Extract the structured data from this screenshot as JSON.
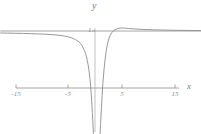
{
  "figure": {
    "axis_labels": {
      "x": "x",
      "y": "y"
    },
    "x_ticks": [
      {
        "value": -15,
        "label": "-15",
        "px": 16
      },
      {
        "value": -5,
        "label": "-5",
        "px": 68
      },
      {
        "value": 5,
        "label": "5",
        "px": 122
      },
      {
        "value": 15,
        "label": "15",
        "px": 175
      }
    ],
    "y_ticks": [
      {
        "value": 1,
        "label": "1",
        "px": 31
      }
    ],
    "colors": {
      "axis": "#9a9a9a",
      "curve": "#8c8c8c",
      "asymptote": "#9a9a9a",
      "text": "#7d7d7d",
      "background": "#ffffff"
    }
  },
  "chart_data": {
    "type": "line",
    "title": "",
    "xlabel": "x",
    "ylabel": "y",
    "xlim": [
      -17.8,
      20.0
    ],
    "ylim": [
      -1.55,
      1.35
    ],
    "grid": false,
    "legend": null,
    "annotations": [
      {
        "text": "horizontal asymptote y = 1"
      },
      {
        "text": "sharp downward spike near x = 0"
      }
    ],
    "xticks": [
      -15,
      -5,
      5,
      15
    ],
    "yticks": [
      1
    ],
    "series": [
      {
        "name": "asymptote",
        "style": "solid",
        "x": [
          -17.8,
          20.0
        ],
        "y": [
          1,
          1
        ]
      },
      {
        "name": "curve",
        "style": "solid",
        "x": [
          -17.8,
          -16.5,
          -15.0,
          -13.5,
          -12.0,
          -10.5,
          -9.5,
          -8.5,
          -7.5,
          -6.8,
          -6.2,
          -5.6,
          -5.0,
          -4.5,
          -4.1,
          -3.7,
          -3.3,
          -3.0,
          -2.7,
          -2.45,
          -2.2,
          -2.0,
          -1.8,
          -1.6,
          -1.45,
          -1.3,
          -1.15,
          -1.0,
          -0.88,
          -0.75,
          -0.62,
          -0.5,
          -0.38,
          -0.25,
          -0.12,
          0.0,
          0.12,
          0.25,
          0.38,
          0.5,
          0.62,
          0.75,
          0.9,
          1.05,
          1.2,
          1.35,
          1.5,
          1.7,
          1.9,
          2.1,
          2.35,
          2.6,
          2.9,
          3.2,
          3.6,
          4.0,
          4.5,
          5.0,
          5.6,
          6.3,
          7.2,
          8.2,
          9.5,
          11.0,
          13.0,
          15.5,
          18.0,
          20.0
        ],
        "y": [
          0.965,
          0.963,
          0.96,
          0.957,
          0.953,
          0.948,
          0.944,
          0.939,
          0.932,
          0.925,
          0.918,
          0.908,
          0.896,
          0.882,
          0.868,
          0.85,
          0.827,
          0.805,
          0.775,
          0.742,
          0.7,
          0.66,
          0.608,
          0.545,
          0.485,
          0.408,
          0.318,
          0.205,
          0.09,
          -0.06,
          -0.235,
          -0.43,
          -0.65,
          -0.88,
          -1.09,
          -1.25,
          -1.36,
          -1.42,
          -1.43,
          -1.39,
          -1.29,
          -1.14,
          -0.9,
          -0.64,
          -0.37,
          -0.12,
          0.095,
          0.32,
          0.5,
          0.64,
          0.77,
          0.86,
          0.93,
          0.975,
          1.015,
          1.035,
          1.048,
          1.052,
          1.05,
          1.045,
          1.038,
          1.032,
          1.026,
          1.021,
          1.016,
          1.012,
          1.009,
          1.007
        ]
      }
    ]
  }
}
